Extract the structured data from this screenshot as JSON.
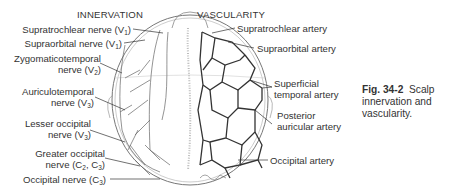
{
  "figure": {
    "headers": {
      "left": "INNERVATION",
      "right": "VASCULARITY"
    },
    "innervation_labels": [
      {
        "text": "Supratrochlear nerve (V",
        "sub": "1",
        "close": ")"
      },
      {
        "text": "Supraorbital nerve (V",
        "sub": "1",
        "close": ")"
      },
      {
        "line1": "Zygomaticotemporal",
        "line2": "nerve (V",
        "sub": "2",
        "close": ")"
      },
      {
        "line1": "Auriculotemporal",
        "line2": "nerve (V",
        "sub": "3",
        "close": ")"
      },
      {
        "line1": "Lesser occipital",
        "line2": "nerve (V",
        "sub": "3",
        "close": ")"
      },
      {
        "line1": "Greater occipital",
        "line2": "nerve (C",
        "sub": "2",
        "mid": ", C",
        "sub2": "3",
        "close": ")"
      },
      {
        "text": "Occipital nerve (C",
        "sub": "3",
        "close": ")"
      }
    ],
    "vascularity_labels": [
      {
        "text": "Supratrochlear artery"
      },
      {
        "text": "Supraorbital artery"
      },
      {
        "line1": "Superficial",
        "line2": "temporal artery"
      },
      {
        "line1": "Posterior",
        "line2": "auricular artery"
      },
      {
        "text": "Occipital artery"
      }
    ],
    "caption": {
      "number": "Fig. 34-2",
      "text": "Scalp innervation and vascularity."
    }
  }
}
